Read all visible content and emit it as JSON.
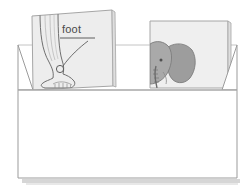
{
  "illustration": {
    "title": "Open box containing two picture cards",
    "description": "Line drawing of an open cardboard box holding two upright flashcards; the left card shows a human leg and foot labeled with a word, the right card shows a gray elephant head with a large ear.",
    "background_color": "#ffffff",
    "outline_color": "#8a8a8a",
    "box": {
      "name": "open-box",
      "fill_color": "#ffffff",
      "stroke_color": "#9a9a9a",
      "back_edge_color": "#bdbdbd",
      "shadow_color": "#c9c9c9"
    },
    "cards": [
      {
        "name": "card-foot",
        "label": "foot",
        "label_underline": true,
        "leader_line": true,
        "tilted": true,
        "fill_color": "#ececec",
        "stroke_color": "#a8a8a8",
        "drawing": "leg-and-foot-line-drawing",
        "detail_notes": "ankle circle marker, five toes, calf contour lines"
      },
      {
        "name": "card-elephant",
        "label": "",
        "label_underline": false,
        "leader_line": false,
        "tilted": false,
        "fill_color": "#eeeeee",
        "stroke_color": "#a8a8a8",
        "drawing": "elephant-head-with-large-ear",
        "shade_color": "#9e9e9e",
        "detail_notes": "gray filled ear, trunk, eye"
      }
    ]
  }
}
